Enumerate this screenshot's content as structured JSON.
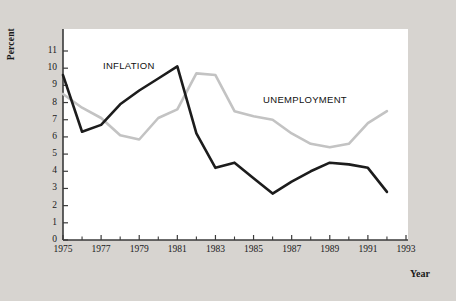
{
  "chart_data": {
    "type": "line",
    "title": "",
    "xlabel": "Year",
    "ylabel": "Percent",
    "xlim": [
      1975,
      1993
    ],
    "ylim": [
      0,
      11
    ],
    "grid": false,
    "legend_position": "inline-annotations",
    "x_ticks": [
      "1975",
      "1977",
      "1979",
      "1981",
      "1983",
      "1985",
      "1987",
      "1989",
      "1991",
      "1993"
    ],
    "x_tick_values": [
      1975,
      1977,
      1979,
      1981,
      1983,
      1985,
      1987,
      1989,
      1991,
      1993
    ],
    "x_minor_tick_values": [
      1976,
      1978,
      1980,
      1982,
      1984,
      1986,
      1988,
      1990,
      1992
    ],
    "y_ticks": [
      "0",
      "1",
      "2",
      "3",
      "4",
      "5",
      "6",
      "7",
      "8",
      "9",
      "10",
      "11"
    ],
    "y_tick_values": [
      0,
      1,
      2,
      3,
      4,
      5,
      6,
      7,
      8,
      9,
      10,
      11
    ],
    "x": [
      1975,
      1976,
      1977,
      1978,
      1979,
      1980,
      1981,
      1982,
      1983,
      1984,
      1985,
      1986,
      1987,
      1988,
      1989,
      1990,
      1991,
      1992
    ],
    "series": [
      {
        "name": "INFLATION",
        "color": "#1c1c1c",
        "label_x": 1977.1,
        "label_y": 10.15,
        "values": [
          9.6,
          6.3,
          6.7,
          7.9,
          8.7,
          9.4,
          10.1,
          6.2,
          4.2,
          4.5,
          3.6,
          2.7,
          3.4,
          4.0,
          4.5,
          4.4,
          4.2,
          2.8
        ]
      },
      {
        "name": "UNEMPLOYMENT",
        "color": "#c3c3c3",
        "label_x": 1985.5,
        "label_y": 8.15,
        "values": [
          8.5,
          7.7,
          7.1,
          6.1,
          5.85,
          7.1,
          7.6,
          9.7,
          9.6,
          7.5,
          7.2,
          7.0,
          6.2,
          5.6,
          5.4,
          5.6,
          6.8,
          7.5
        ]
      }
    ]
  },
  "axis": {
    "ylabel_text": "Percent",
    "xlabel_text": "Year"
  }
}
